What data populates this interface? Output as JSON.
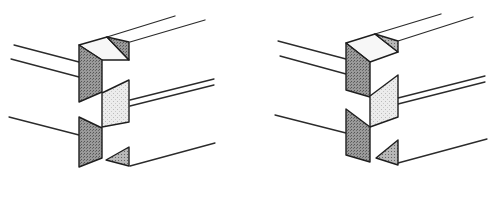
{
  "figure": {
    "colors": {
      "background": "#ffffff",
      "ink": "#2b2b2b",
      "dark_stipple": "#8a8a8a",
      "light_stipple": "#d9d9d9"
    },
    "panels": [
      {
        "id": "left-joint",
        "label": ""
      },
      {
        "id": "right-joint",
        "label": ""
      }
    ]
  }
}
